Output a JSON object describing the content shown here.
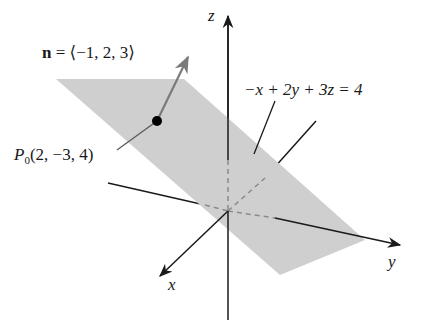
{
  "figure": {
    "type": "3d-plane-diagram",
    "colors": {
      "plane_fill": "#cfcfcf",
      "axis": "#1a1a1a",
      "normal_vector": "#7a7a7a",
      "point": "#000000",
      "dashed_hidden": "#8a8a8a"
    },
    "axes": {
      "x": {
        "label": "x"
      },
      "y": {
        "label": "y"
      },
      "z": {
        "label": "z"
      }
    },
    "normal_vector": {
      "symbol": "n",
      "equals": "=",
      "components": "⟨−1, 2, 3⟩"
    },
    "point": {
      "name": "P",
      "subscript": "0",
      "coordinates": "(2, −3, 4)"
    },
    "plane": {
      "equation": "−x + 2y + 3z = 4"
    }
  }
}
